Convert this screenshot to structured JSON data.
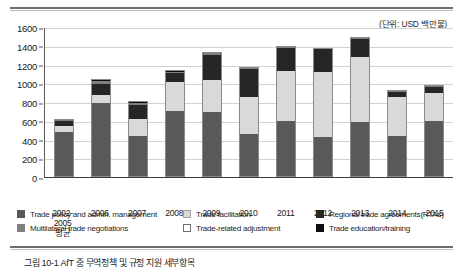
{
  "unit_note": "(단위: USD 백만불)",
  "caption": "그림 10-1  AfT 중 무역정책 및 규정 지원 세부항목",
  "axis": {
    "y_ticks": [
      "1600",
      "1400",
      "1200",
      "1000",
      "800",
      "600",
      "400",
      "200",
      "0"
    ],
    "y_max": 1600,
    "y_min": 0
  },
  "legend": {
    "row1": [
      {
        "key": "trade_policy",
        "label": "Trade policy and admin. management",
        "swatch": "s0",
        "color": "#595959"
      },
      {
        "key": "trade_facilitation",
        "label": "Trade facilitation",
        "swatch": "s1",
        "color": "#d9d9d9"
      },
      {
        "key": "rtas",
        "label": "Regional trade agreements(RTAs)",
        "swatch": "s2",
        "color": "#262626"
      }
    ],
    "row2": [
      {
        "key": "multilateral",
        "label": "Multilateral trade negotiations",
        "swatch": "s3",
        "color": "#7f7f7f"
      },
      {
        "key": "adjustment",
        "label": "Trade-related adjustment",
        "swatch": "s4",
        "color": "#ffffff"
      },
      {
        "key": "education",
        "label": "Trade education/training",
        "swatch": "s5",
        "color": "#0d0d0d"
      }
    ]
  },
  "chart_data": {
    "type": "bar",
    "stacked": true,
    "title": "",
    "subtitle": "",
    "xlabel": "",
    "ylabel": "",
    "unit": "USD 백만불",
    "ylim": [
      0,
      1600
    ],
    "grid": true,
    "legend_position": "bottom",
    "categories": [
      "2002-2005 평균",
      "2006",
      "2007",
      "2008",
      "2009",
      "2010",
      "2011",
      "2012",
      "2013",
      "2014",
      "2015"
    ],
    "category_lines": [
      [
        "2002-2005",
        "평균"
      ],
      [
        "2006",
        ""
      ],
      [
        "2007",
        ""
      ],
      [
        "2008",
        ""
      ],
      [
        "2009",
        ""
      ],
      [
        "2010",
        ""
      ],
      [
        "2011",
        ""
      ],
      [
        "2012",
        ""
      ],
      [
        "2013",
        ""
      ],
      [
        "2014",
        ""
      ],
      [
        "2015",
        ""
      ]
    ],
    "series": [
      {
        "name": "Trade policy and admin. management",
        "color": "#595959",
        "values": [
          475,
          790,
          440,
          700,
          690,
          455,
          600,
          430,
          585,
          440,
          600
        ]
      },
      {
        "name": "Trade facilitation",
        "color": "#d9d9d9",
        "values": [
          65,
          85,
          175,
          310,
          340,
          395,
          530,
          690,
          700,
          415,
          300
        ]
      },
      {
        "name": "Regional trade agreements(RTAs)",
        "color": "#262626",
        "values": [
          60,
          120,
          150,
          95,
          275,
          300,
          250,
          245,
          185,
          55,
          65
        ]
      },
      {
        "name": "Multilateral trade negotiations",
        "color": "#7f7f7f",
        "values": [
          10,
          30,
          25,
          20,
          20,
          15,
          10,
          10,
          10,
          10,
          10
        ]
      },
      {
        "name": "Trade-related adjustment",
        "color": "#ffffff",
        "values": [
          0,
          0,
          0,
          0,
          0,
          0,
          0,
          0,
          0,
          0,
          0
        ]
      },
      {
        "name": "Trade education/training",
        "color": "#0d0d0d",
        "values": [
          10,
          20,
          20,
          15,
          10,
          10,
          10,
          5,
          10,
          10,
          10
        ]
      }
    ],
    "totals": [
      620,
      1045,
      810,
      1140,
      1335,
      1175,
      1400,
      1380,
      1490,
      930,
      985
    ]
  }
}
